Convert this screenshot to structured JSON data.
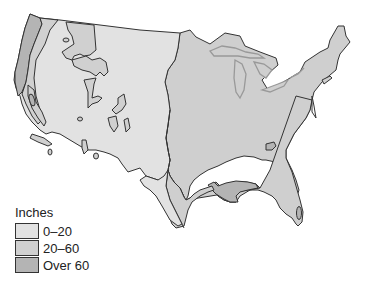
{
  "map": {
    "subject": "Average annual precipitation, contiguous United States",
    "regions": [
      {
        "name": "west-dry",
        "category": "0–20"
      },
      {
        "name": "east-moderate",
        "category": "20–60"
      },
      {
        "name": "pacific-northwest-wet",
        "category": "Over 60"
      },
      {
        "name": "gulf-coast-wet",
        "category": "Over 60"
      },
      {
        "name": "southern-appalachian-wet",
        "category": "Over 60"
      },
      {
        "name": "south-florida-wet",
        "category": "Over 60"
      }
    ]
  },
  "legend": {
    "title": "Inches",
    "items": [
      {
        "label": "0–20",
        "color": "#e2e2e2"
      },
      {
        "label": "20–60",
        "color": "#d0d0d0"
      },
      {
        "label": "Over 60",
        "color": "#b4b4b4"
      }
    ]
  },
  "colors": {
    "dry": "#e2e2e2",
    "moderate": "#cfcfcf",
    "wet": "#b4b4b4",
    "outline": "#333333",
    "lakes": "#999999"
  }
}
